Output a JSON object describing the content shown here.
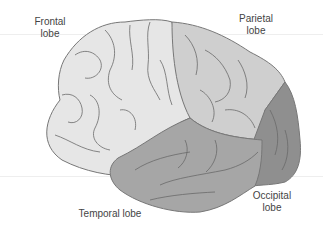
{
  "diagram": {
    "labels": {
      "frontal": [
        "Frontal",
        "lobe"
      ],
      "parietal": [
        "Parietal",
        "lobe"
      ],
      "temporal": "Temporal lobe",
      "occipital": [
        "Occipital",
        "lobe"
      ]
    },
    "colors": {
      "frontal": "#e6e6e6",
      "parietal": "#cfcfcf",
      "temporal": "#a6a6a6",
      "occipital": "#8f8f8f",
      "sulci": "#6a6a6a",
      "outline": "#777777",
      "text": "#444444"
    }
  }
}
